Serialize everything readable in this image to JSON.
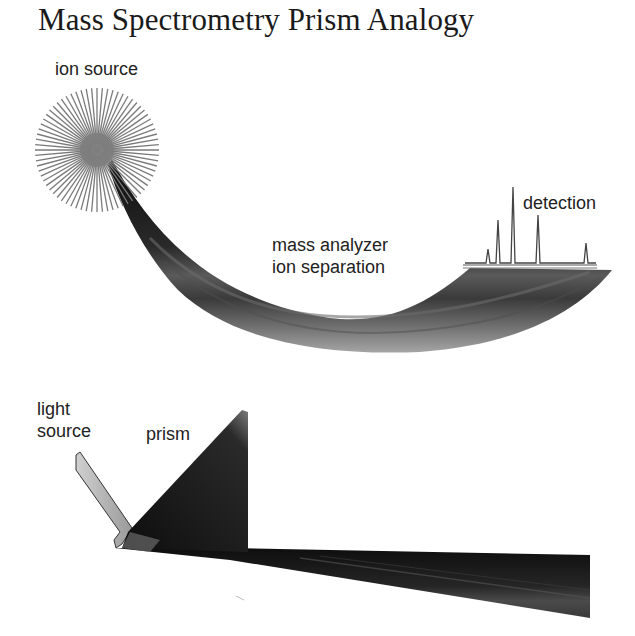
{
  "title": "Mass Spectrometry Prism Analogy",
  "top_panel": {
    "labels": {
      "ion_source": "ion source",
      "mass_analyzer_line1": "mass analyzer",
      "mass_analyzer_line2": "ion separation",
      "detection": "detection"
    },
    "icons": {
      "ion_source": "starburst-icon",
      "spectrum": "mass-spectrum-peaks"
    },
    "spectrum_peaks": [
      {
        "x": 488,
        "height": 14
      },
      {
        "x": 498,
        "height": 43
      },
      {
        "x": 513,
        "height": 76
      },
      {
        "x": 538,
        "height": 48
      },
      {
        "x": 586,
        "height": 20
      }
    ]
  },
  "bottom_panel": {
    "labels": {
      "light_source_line1": "light",
      "light_source_line2": "source",
      "prism": "prism"
    }
  },
  "colors": {
    "background": "#ffffff",
    "text": "#222222",
    "beam_dark": "#111111",
    "beam_mid": "#555555",
    "beam_light": "#9a9a9a",
    "starburst": "#7a7a7a"
  }
}
